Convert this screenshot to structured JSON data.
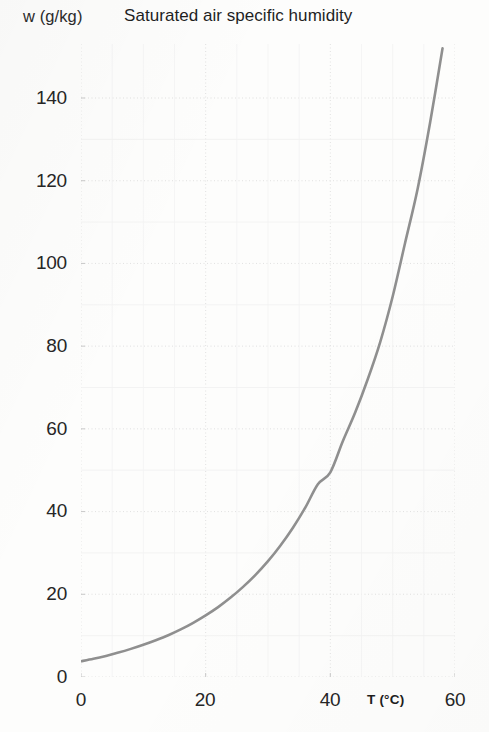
{
  "header": {
    "y_axis_title": "w (g/kg)",
    "chart_title": "Saturated air specific humidity"
  },
  "axes": {
    "x_axis_title": "T (°C)",
    "y_tick_labels": [
      "0",
      "20",
      "40",
      "60",
      "80",
      "100",
      "120",
      "140"
    ],
    "x_tick_labels": [
      "0",
      "20",
      "40",
      "60"
    ]
  },
  "style": {
    "curve_color": "#8f8f8f",
    "grid_color": "#dedede",
    "text_color": "#262626",
    "background": "#fdfdfc"
  },
  "chart_data": {
    "type": "line",
    "title": "Saturated air specific humidity",
    "xlabel": "T (°C)",
    "ylabel": "w (g/kg)",
    "xlim": [
      0,
      60
    ],
    "ylim": [
      0,
      152
    ],
    "xticks": [
      0,
      20,
      40,
      60
    ],
    "yticks": [
      0,
      20,
      40,
      60,
      80,
      100,
      120,
      140
    ],
    "grid": true,
    "legend": null,
    "series": [
      {
        "name": "Saturated air specific humidity",
        "x": [
          0,
          2,
          4,
          6,
          8,
          10,
          12,
          14,
          16,
          18,
          20,
          22,
          24,
          26,
          28,
          30,
          32,
          34,
          36,
          38,
          40,
          42,
          44,
          46,
          48,
          50,
          52,
          54,
          56,
          58
        ],
        "y": [
          3.8,
          4.4,
          5.1,
          5.9,
          6.8,
          7.8,
          8.9,
          10.1,
          11.5,
          13.1,
          14.9,
          16.9,
          19.2,
          21.8,
          24.7,
          28.0,
          31.8,
          36.1,
          41.0,
          46.6,
          49.5,
          57.0,
          64.0,
          72.0,
          81.0,
          92.0,
          105.0,
          118.0,
          134.0,
          152.0
        ]
      }
    ]
  }
}
